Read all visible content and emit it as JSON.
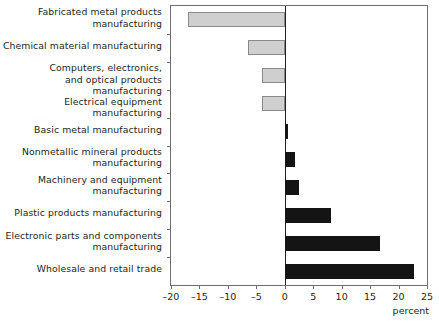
{
  "chart_data": {
    "type": "bar",
    "orientation": "horizontal",
    "title": "",
    "xlabel": "percent",
    "ylabel": "",
    "xlim": [
      -20,
      25
    ],
    "xticks": [
      -20,
      -15,
      -10,
      -5,
      0,
      5,
      10,
      15,
      20,
      25
    ],
    "xtick_labels": [
      "–20",
      "–15",
      "–10",
      "–5",
      "0",
      "5",
      "10",
      "15",
      "20",
      "25"
    ],
    "grid": false,
    "legend": "none",
    "categories": [
      "Fabricated metal products\nmanufacturing",
      "Chemical material manufacturing",
      "Computers, electronics,\nand optical products manufacturing",
      "Electrical equipment manufacturing",
      "Basic metal manufacturing",
      "Nonmetallic mineral products\nmanufacturing",
      "Machinery and equipment\nmanufacturing",
      "Plastic products manufacturing",
      "Electronic parts and components\nmanufacturing",
      "Wholesale and retail trade"
    ],
    "values": [
      -17.0,
      -6.5,
      -4.0,
      -4.0,
      0.5,
      1.8,
      2.5,
      8.2,
      16.8,
      22.8
    ],
    "colors": {
      "negative_fill": "#cfcfcf",
      "negative_edge": "#8a8a8a",
      "positive_fill": "#141414",
      "axis": "#6f6f6f",
      "text": "#231f20",
      "background": "#ffffff"
    }
  }
}
